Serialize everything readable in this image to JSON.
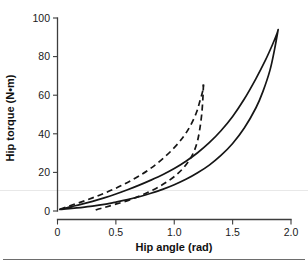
{
  "chart_data": {
    "type": "line",
    "title": "",
    "xlabel": "Hip angle (rad)",
    "ylabel": "Hip torque (N•m)",
    "xlim": [
      0,
      2.0
    ],
    "ylim": [
      0,
      100
    ],
    "xticks": [
      "0",
      "0.5",
      "1.0",
      "1.5",
      "2.0"
    ],
    "xtick_values": [
      0,
      0.5,
      1.0,
      1.5,
      2.0
    ],
    "yticks": [
      "0",
      "20",
      "40",
      "60",
      "80",
      "100"
    ],
    "ytick_values": [
      0,
      20,
      40,
      60,
      80,
      100
    ],
    "grid": false,
    "legend": null,
    "series": [
      {
        "name": "solid-hysteresis-loop",
        "style": "solid",
        "color": "#161616",
        "loading_branch": [
          [
            0.02,
            0.8
          ],
          [
            0.1,
            2.0
          ],
          [
            0.2,
            3.4
          ],
          [
            0.3,
            5.0
          ],
          [
            0.4,
            6.8
          ],
          [
            0.5,
            8.8
          ],
          [
            0.6,
            11.0
          ],
          [
            0.7,
            13.4
          ],
          [
            0.8,
            16.0
          ],
          [
            0.9,
            18.8
          ],
          [
            1.0,
            22.0
          ],
          [
            1.1,
            25.8
          ],
          [
            1.2,
            30.2
          ],
          [
            1.3,
            35.4
          ],
          [
            1.4,
            41.6
          ],
          [
            1.5,
            49.0
          ],
          [
            1.6,
            58.0
          ],
          [
            1.7,
            68.6
          ],
          [
            1.78,
            78.0
          ],
          [
            1.84,
            86.0
          ],
          [
            1.88,
            92.0
          ],
          [
            1.89,
            94.0
          ]
        ],
        "unloading_branch": [
          [
            1.89,
            94.0
          ],
          [
            1.86,
            84.0
          ],
          [
            1.82,
            73.0
          ],
          [
            1.76,
            62.0
          ],
          [
            1.7,
            53.5
          ],
          [
            1.6,
            43.0
          ],
          [
            1.5,
            35.0
          ],
          [
            1.4,
            28.8
          ],
          [
            1.3,
            23.8
          ],
          [
            1.2,
            19.8
          ],
          [
            1.1,
            16.4
          ],
          [
            1.0,
            13.6
          ],
          [
            0.9,
            11.2
          ],
          [
            0.8,
            9.2
          ],
          [
            0.7,
            7.4
          ],
          [
            0.6,
            5.9
          ],
          [
            0.5,
            4.6
          ],
          [
            0.4,
            3.4
          ],
          [
            0.3,
            2.5
          ],
          [
            0.2,
            1.8
          ],
          [
            0.1,
            1.2
          ],
          [
            0.02,
            0.8
          ]
        ],
        "peak": [
          1.89,
          94.0
        ]
      },
      {
        "name": "dashed-hysteresis-loop",
        "style": "dashed",
        "color": "#161616",
        "loading_branch": [
          [
            0.02,
            0.9
          ],
          [
            0.1,
            2.6
          ],
          [
            0.2,
            4.6
          ],
          [
            0.3,
            6.8
          ],
          [
            0.4,
            9.2
          ],
          [
            0.5,
            11.8
          ],
          [
            0.6,
            14.8
          ],
          [
            0.7,
            18.2
          ],
          [
            0.8,
            22.2
          ],
          [
            0.9,
            27.0
          ],
          [
            1.0,
            32.8
          ],
          [
            1.08,
            38.6
          ],
          [
            1.14,
            44.4
          ],
          [
            1.19,
            51.0
          ],
          [
            1.22,
            57.0
          ],
          [
            1.245,
            62.5
          ],
          [
            1.25,
            65.5
          ]
        ],
        "unloading_branch": [
          [
            1.25,
            65.5
          ],
          [
            1.245,
            58.0
          ],
          [
            1.235,
            50.0
          ],
          [
            1.22,
            43.0
          ],
          [
            1.2,
            36.5
          ],
          [
            1.17,
            31.0
          ],
          [
            1.13,
            26.4
          ],
          [
            1.08,
            22.4
          ],
          [
            1.02,
            18.8
          ],
          [
            0.95,
            15.6
          ],
          [
            0.87,
            12.6
          ],
          [
            0.78,
            9.8
          ],
          [
            0.68,
            7.2
          ],
          [
            0.58,
            5.0
          ],
          [
            0.48,
            3.2
          ],
          [
            0.4,
            1.8
          ],
          [
            0.34,
            0.8
          ],
          [
            0.32,
            0.3
          ]
        ],
        "peak": [
          1.25,
          65.5
        ]
      }
    ]
  },
  "figure": {
    "xaxis_title": "Hip angle (rad)",
    "yaxis_title": "Hip torque (N•m)"
  }
}
